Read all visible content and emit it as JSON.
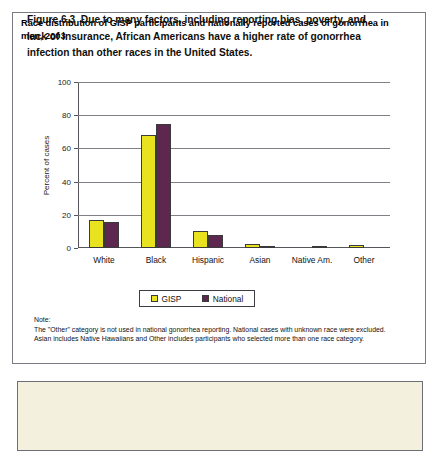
{
  "chart_title": "Race distribution of GISP participants and nationally reported cases of gonorrhea in men, 2003",
  "legend": {
    "items": [
      {
        "label": "GISP",
        "color": "#e9e21f"
      },
      {
        "label": "National",
        "color": "#5e2750"
      }
    ]
  },
  "note": {
    "label": "Note:",
    "text": "The \"Other\" category is not used in national gonorrhea reporting. National cases with unknown race were excluded. Asian includes Native Hawaiians and Other includes participants who selected more than one race category."
  },
  "caption": {
    "number": "Figure 6.3",
    "text": "Due to many factors, including reporting bias, poverty, and lack of insurance, African Americans have a higher rate of gonorrhea infection than other races in the United States."
  },
  "chart_data": {
    "type": "bar",
    "title": "Race distribution of GISP participants and nationally reported cases of gonorrhea in men, 2003",
    "xlabel": "",
    "ylabel": "Percent of cases",
    "ylim": [
      0,
      100
    ],
    "yticks": [
      0,
      20,
      40,
      60,
      80,
      100
    ],
    "grid": true,
    "legend_position": "bottom",
    "categories": [
      "White",
      "Black",
      "Hispanic",
      "Asian",
      "Native Am.",
      "Other"
    ],
    "series": [
      {
        "name": "GISP",
        "color": "#e9e21f",
        "values": [
          17,
          68,
          10.5,
          2.5,
          0,
          2
        ]
      },
      {
        "name": "National",
        "color": "#5e2750",
        "values": [
          15.5,
          75,
          8,
          0.8,
          0.4,
          0
        ]
      }
    ]
  }
}
